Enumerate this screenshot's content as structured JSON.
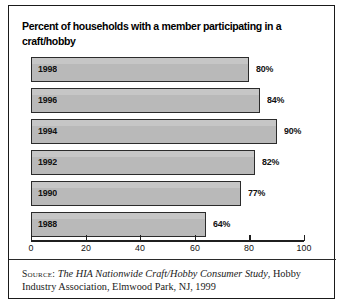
{
  "figure": {
    "title": "Percent of households with a member participating in a craft/hobby",
    "source_label": "Source:",
    "source_title": "The HIA Nationwide Craft/Hobby Consumer Study",
    "source_rest": ", Hobby Industry Association, Elmwood Park, NJ, 1999",
    "border_color": "#1a1a1a",
    "bar_fill": "#b9b9b9",
    "bar_stroke": "#2b2b2b",
    "text_color": "#111111"
  },
  "chart_data": {
    "type": "bar",
    "orientation": "horizontal",
    "title": "Percent of households with a member participating in a craft/hobby",
    "xlabel": "",
    "ylabel": "",
    "categories": [
      "1998",
      "1996",
      "1994",
      "1992",
      "1990",
      "1988"
    ],
    "values": [
      80,
      84,
      90,
      82,
      77,
      64
    ],
    "value_labels": [
      "80%",
      "84%",
      "90%",
      "82%",
      "77%",
      "64%"
    ],
    "xlim": [
      0,
      100
    ],
    "xticks": [
      0,
      20,
      40,
      60,
      80,
      100
    ],
    "xtick_labels": [
      "0",
      "20",
      "40",
      "60",
      "80",
      "100"
    ],
    "grid": false,
    "legend": false
  }
}
